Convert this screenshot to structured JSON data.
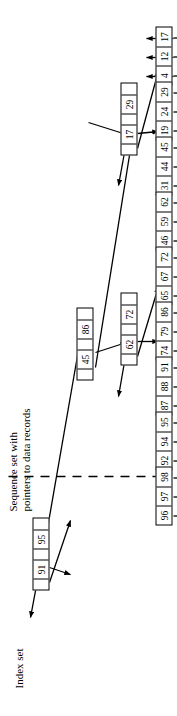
{
  "figure": {
    "labels": {
      "index_set": "Index set",
      "sequence_set": "Sequence set with\npointers to data records",
      "sequence_set_line1": "Sequence set with",
      "sequence_set_line2": "pointers to data records"
    },
    "divider": {
      "style": "dashed",
      "color": "#000000"
    },
    "colors": {
      "line": "#000000",
      "box_fill": "#ffffff",
      "text": "#000000"
    }
  },
  "tree": {
    "root": {
      "id": "root",
      "keys": [
        "45",
        "86"
      ],
      "slots": [
        "",
        "45",
        "",
        "86",
        ""
      ]
    },
    "internal_nodes": [
      {
        "id": "n-17-29",
        "keys": [
          "17",
          "29"
        ],
        "slots": [
          "",
          "17",
          "",
          "29",
          ""
        ]
      },
      {
        "id": "n-62-72",
        "keys": [
          "62",
          "72"
        ],
        "slots": [
          "",
          "62",
          "",
          "72",
          ""
        ]
      },
      {
        "id": "n-91-95",
        "keys": [
          "91",
          "95"
        ],
        "slots": [
          "",
          "91",
          "",
          "95",
          ""
        ]
      }
    ],
    "leaves": [
      {
        "id": "leaf-1",
        "keys": [
          "4",
          "12",
          "17"
        ],
        "record_pointers": 3
      },
      {
        "id": "leaf-2",
        "keys": [
          "19",
          "24",
          "29"
        ],
        "record_pointers": 3
      },
      {
        "id": "leaf-3",
        "keys": [
          "31",
          "44",
          "45"
        ],
        "record_pointers": 3
      },
      {
        "id": "leaf-4",
        "keys": [
          "46",
          "59",
          "62"
        ],
        "record_pointers": 3
      },
      {
        "id": "leaf-5",
        "keys": [
          "65",
          "67",
          "72"
        ],
        "record_pointers": 3
      },
      {
        "id": "leaf-6",
        "keys": [
          "74",
          "79",
          "86"
        ],
        "record_pointers": 3
      },
      {
        "id": "leaf-7",
        "keys": [
          "87",
          "88",
          "91"
        ],
        "record_pointers": 3
      },
      {
        "id": "leaf-8",
        "keys": [
          "92",
          "94",
          "95"
        ],
        "record_pointers": 3
      },
      {
        "id": "leaf-9",
        "keys": [
          "96",
          "97",
          "98"
        ],
        "record_pointers": 3
      }
    ]
  }
}
